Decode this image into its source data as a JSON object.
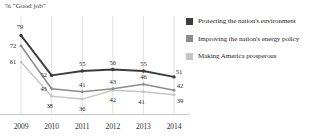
{
  "chart_data": {
    "type": "line",
    "title": "% \"Good job\"",
    "xlabel": "",
    "ylabel": "",
    "categories": [
      "2009",
      "2010",
      "2011",
      "2012",
      "2013",
      "2014"
    ],
    "xlim": [
      2009,
      2014
    ],
    "ylim": [
      30,
      82
    ],
    "grid": "vertical",
    "legend_position": "right",
    "series": [
      {
        "name": "Protecting the nation's environment",
        "color": "#3c3c3c",
        "values": [
          79,
          52,
          55,
          56,
          55,
          51
        ]
      },
      {
        "name": "Improving the nation's energy policy",
        "color": "#8c8c8c",
        "values": [
          72,
          43,
          41,
          43,
          46,
          42
        ]
      },
      {
        "name": "Making America prosperous",
        "color": "#c6c6c6",
        "values": [
          61,
          38,
          36,
          42,
          41,
          39
        ]
      }
    ]
  },
  "legend": {
    "items": [
      {
        "label": "Protecting the nation's environment",
        "color": "#3c3c3c"
      },
      {
        "label": "Improving the nation's energy policy",
        "color": "#8c8c8c"
      },
      {
        "label": "Making America prosperous",
        "color": "#c6c6c6"
      }
    ]
  },
  "axis": {
    "x_ticks": [
      "2009",
      "2010",
      "2011",
      "2012",
      "2013",
      "2014"
    ]
  },
  "colors": {
    "series_dark": "#3c3c3c",
    "series_medium": "#8c8c8c",
    "series_light": "#c6c6c6",
    "gridline": "#c9c9c9",
    "baseline": "#b4b4b4",
    "text": "#2a2a2a"
  }
}
